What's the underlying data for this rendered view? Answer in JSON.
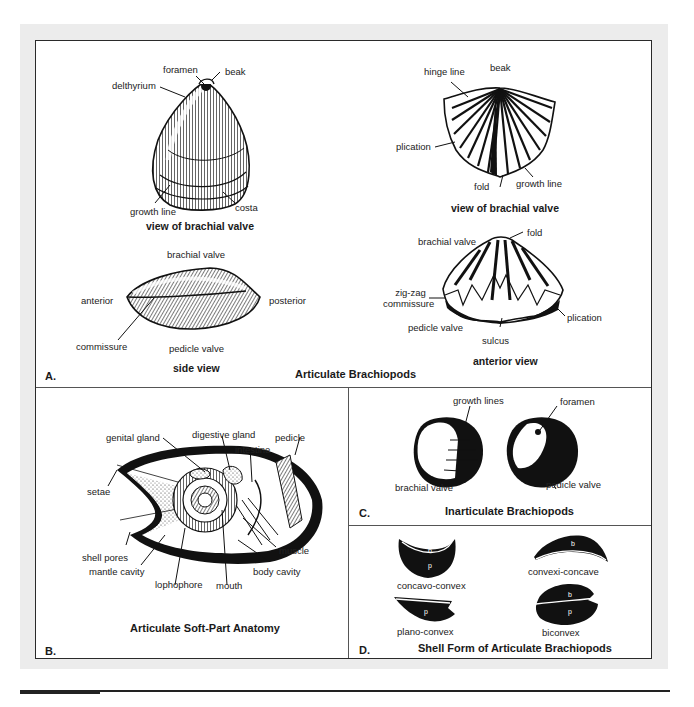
{
  "figure": {
    "panels": {
      "A": {
        "letter": "A.",
        "title": "Articulate Brachiopods",
        "brachial_view_left": {
          "caption": "view of brachial valve",
          "labels": {
            "foramen": "foramen",
            "beak": "beak",
            "delthyrium": "delthyrium",
            "growth_line": "growth line",
            "costa": "costa"
          }
        },
        "side_view": {
          "caption": "side view",
          "labels": {
            "brachial_valve": "brachial valve",
            "anterior": "anterior",
            "posterior": "posterior",
            "commissure": "commissure",
            "pedicle_valve": "pedicle valve"
          }
        },
        "brachial_view_right": {
          "caption": "view of brachial valve",
          "labels": {
            "hinge_line": "hinge line",
            "beak": "beak",
            "plication": "plication",
            "fold": "fold",
            "growth_line": "growth line"
          }
        },
        "anterior_view": {
          "caption": "anterior view",
          "labels": {
            "fold": "fold",
            "brachial_valve": "brachial valve",
            "zigzag_1": "zig-zag",
            "zigzag_2": "commissure",
            "pedicle_valve": "pedicle valve",
            "sulcus": "sulcus",
            "plication": "plication"
          }
        }
      },
      "B": {
        "letter": "B.",
        "title": "Articulate Soft-Part Anatomy",
        "labels": {
          "genital_gland": "genital gland",
          "digestive_gland": "digestive gland",
          "pedicle": "pedicle",
          "intestine": "intestine",
          "setae": "setae",
          "shell_pores": "shell pores",
          "mantle_cavity": "mantle cavity",
          "lophophore": "lophophore",
          "mouth": "mouth",
          "muscle": "muscle",
          "body_cavity": "body cavity"
        }
      },
      "C": {
        "letter": "C.",
        "title": "Inarticulate Brachiopods",
        "labels": {
          "growth_lines": "growth lines",
          "foramen": "foramen",
          "brachial_valve": "brachial valve",
          "pedicle_valve": "pedicle valve"
        }
      },
      "D": {
        "letter": "D.",
        "title": "Shell Form of Articulate Brachiopods",
        "forms": [
          {
            "name": "concavo-convex",
            "top": "b",
            "bottom": "p"
          },
          {
            "name": "convexi-concave",
            "top": "b",
            "bottom": ""
          },
          {
            "name": "plano-convex",
            "top": "",
            "bottom": "p"
          },
          {
            "name": "biconvex",
            "top": "b",
            "bottom": "p"
          }
        ]
      }
    }
  }
}
